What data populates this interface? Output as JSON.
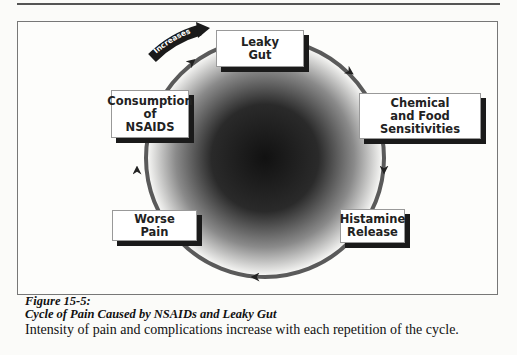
{
  "figure": {
    "number": "Figure 15-5:",
    "title": "Cycle of Pain Caused by NSAIDs and Leaky Gut",
    "description": "Intensity of pain and complications increase with each repetition of the cycle."
  },
  "diagram": {
    "type": "cycle",
    "increase_arrow_label": "Increases",
    "nodes": [
      {
        "id": "leaky-gut",
        "lines": [
          "Leaky",
          "Gut"
        ]
      },
      {
        "id": "chemical-food",
        "lines": [
          "Chemical",
          "and Food",
          "Sensitivities"
        ]
      },
      {
        "id": "histamine",
        "lines": [
          "Histamine",
          "Release"
        ]
      },
      {
        "id": "worse-pain",
        "lines": [
          "Worse",
          "Pain"
        ]
      },
      {
        "id": "nsaids",
        "lines": [
          "Consumption",
          "of",
          "NSAIDS"
        ]
      }
    ],
    "flow": [
      "Leaky Gut",
      "Chemical and Food Sensitivities",
      "Histamine Release",
      "Worse Pain",
      "Consumption of NSAIDS",
      "Leaky Gut"
    ],
    "colors": {
      "ring": "#555555",
      "center_dark": "#111111",
      "edge_light": "#ffffff",
      "shadow": "#1a1a1a"
    }
  }
}
